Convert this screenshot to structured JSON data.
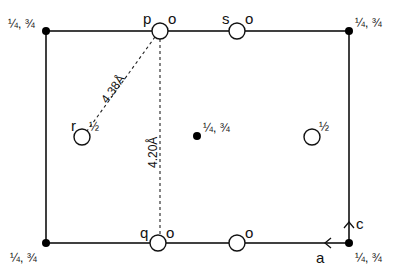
{
  "diagram": {
    "type": "crystal-structure-projection",
    "corner_label": "¼, ¾",
    "center_label": "¼, ¾",
    "height_half": "½",
    "ring_label_o": "o",
    "atoms": {
      "p": {
        "label": "p",
        "height": "o"
      },
      "s": {
        "label": "s",
        "height": "o"
      },
      "q": {
        "label": "q",
        "height": "o"
      },
      "bottom_right": {
        "height": "o"
      },
      "r": {
        "label": "r",
        "height": "½"
      },
      "right_mid": {
        "height": "½"
      }
    },
    "distances": {
      "diagonal": "4.38Å",
      "vertical": "4.20Å"
    },
    "axes": {
      "a": "a",
      "c": "c"
    },
    "colors": {
      "line": "#111111",
      "background": "#ffffff"
    }
  }
}
